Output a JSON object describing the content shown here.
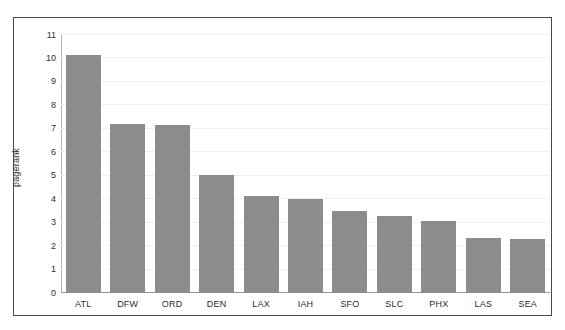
{
  "figure": {
    "top_clipped_text": "",
    "frame_color": "#4a4a4a",
    "background": "#ffffff"
  },
  "chart_data": {
    "type": "bar",
    "title": "",
    "xlabel": "",
    "ylabel": "pagerank",
    "categories": [
      "ATL",
      "DFW",
      "ORD",
      "DEN",
      "LAX",
      "IAH",
      "SFO",
      "SLC",
      "PHX",
      "LAS",
      "SEA"
    ],
    "values": [
      10.15,
      7.22,
      7.15,
      5.05,
      4.15,
      4.0,
      3.5,
      3.3,
      3.05,
      2.35,
      2.3
    ],
    "ylim": [
      0,
      11
    ],
    "yticks": [
      0,
      1,
      2,
      3,
      4,
      5,
      6,
      7,
      8,
      9,
      10,
      11
    ],
    "ytick_labels": [
      "0",
      "1",
      "2",
      "3",
      "4",
      "5",
      "6",
      "7",
      "8",
      "9",
      "10",
      "11"
    ],
    "grid": true,
    "grid_axis": "y",
    "grid_color": "#f0f0f2",
    "legend": null,
    "bar_color": "#8c8c8c",
    "axis_color": "#9a9a9a",
    "orientation": "vertical"
  }
}
